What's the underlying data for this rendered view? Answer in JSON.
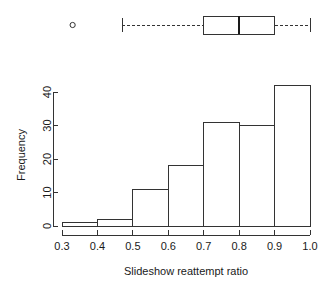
{
  "chart_data": {
    "type": "bar",
    "title": "",
    "subtitle": "",
    "xlabel": "Slideshow reattempt ratio",
    "ylabel": "Frequency",
    "xlim": [
      0.3,
      1.0
    ],
    "ylim": [
      0,
      42
    ],
    "grid": false,
    "legend": "none",
    "bin_edges": [
      0.3,
      0.4,
      0.5,
      0.6,
      0.7,
      0.8,
      0.9,
      1.0
    ],
    "categories": [
      "0.3-0.4",
      "0.4-0.5",
      "0.5-0.6",
      "0.6-0.7",
      "0.7-0.8",
      "0.8-0.9",
      "0.9-1.0"
    ],
    "values": [
      1,
      2,
      11,
      18,
      31,
      30,
      42
    ],
    "xticks": [
      "0.3",
      "0.4",
      "0.5",
      "0.6",
      "0.7",
      "0.8",
      "0.9",
      "1.0"
    ],
    "xtick_values": [
      0.3,
      0.4,
      0.5,
      0.6,
      0.7,
      0.8,
      0.9,
      1.0
    ],
    "yticks": [
      "0",
      "10",
      "20",
      "30",
      "40"
    ],
    "ytick_values": [
      0,
      10,
      20,
      30,
      40
    ],
    "boxplot": {
      "orientation": "horizontal",
      "whisker_low": 0.47,
      "q1": 0.7,
      "median": 0.8,
      "q3": 0.9,
      "whisker_high": 1.0,
      "outliers": [
        0.33
      ]
    }
  },
  "colors": {
    "ink": "#1a1a1a",
    "line": "#333333",
    "background": "#ffffff",
    "bar_fill": "#ffffff"
  }
}
